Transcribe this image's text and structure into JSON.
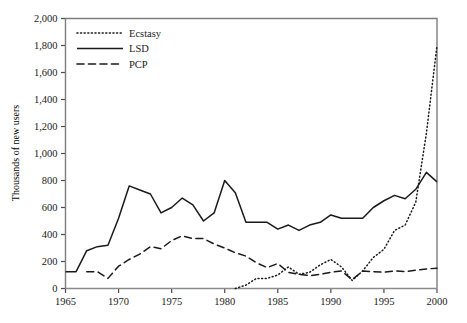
{
  "chart_data": {
    "type": "line",
    "title": "",
    "xlabel": "",
    "ylabel": "Thousands of new users",
    "xlim": [
      1965,
      2000
    ],
    "ylim": [
      0,
      2000
    ],
    "xticks": [
      1965,
      1970,
      1975,
      1980,
      1985,
      1990,
      1995,
      2000
    ],
    "xtick_labels": [
      "1965",
      "1970",
      "1975",
      "1980",
      "1985",
      "1990",
      "1995",
      "2000"
    ],
    "yticks": [
      0,
      200,
      400,
      600,
      800,
      1000,
      1200,
      1400,
      1600,
      1800,
      2000
    ],
    "ytick_labels": [
      "0",
      "200",
      "400",
      "600",
      "800",
      "1,000",
      "1,200",
      "1,400",
      "1,600",
      "1,800",
      "2,000"
    ],
    "grid": false,
    "legend_position": "top-left",
    "x": [
      1965,
      1966,
      1967,
      1968,
      1969,
      1970,
      1971,
      1972,
      1973,
      1974,
      1975,
      1976,
      1977,
      1978,
      1979,
      1980,
      1981,
      1982,
      1983,
      1984,
      1985,
      1986,
      1987,
      1988,
      1989,
      1990,
      1991,
      1992,
      1993,
      1994,
      1995,
      1996,
      1997,
      1998,
      1999,
      2000
    ],
    "series": [
      {
        "name": "Ecstasy",
        "style": "dotted",
        "color": "#1a1a1a",
        "x": [
          1981,
          1982,
          1983,
          1984,
          1985,
          1986,
          1987,
          1988,
          1989,
          1990,
          1991,
          1992,
          1993,
          1994,
          1995,
          1996,
          1997,
          1998,
          1999,
          2000
        ],
        "values": [
          0,
          25,
          75,
          75,
          100,
          160,
          105,
          120,
          175,
          215,
          160,
          60,
          130,
          230,
          290,
          430,
          470,
          640,
          1150,
          1800
        ]
      },
      {
        "name": "LSD",
        "style": "solid",
        "color": "#1a1a1a",
        "x": [
          1965,
          1966,
          1967,
          1968,
          1969,
          1970,
          1971,
          1972,
          1973,
          1974,
          1975,
          1976,
          1977,
          1978,
          1979,
          1980,
          1981,
          1982,
          1983,
          1984,
          1985,
          1986,
          1987,
          1988,
          1989,
          1990,
          1991,
          1992,
          1993,
          1994,
          1995,
          1996,
          1997,
          1998,
          1999,
          2000
        ],
        "values": [
          125,
          125,
          280,
          310,
          320,
          520,
          760,
          730,
          700,
          560,
          600,
          670,
          620,
          500,
          560,
          800,
          710,
          490,
          490,
          490,
          440,
          470,
          430,
          470,
          490,
          545,
          520,
          520,
          520,
          600,
          650,
          690,
          665,
          735,
          860,
          790
        ]
      },
      {
        "name": "PCP",
        "style": "dashed",
        "color": "#1a1a1a",
        "x": [
          1967,
          1968,
          1969,
          1970,
          1971,
          1972,
          1973,
          1974,
          1975,
          1976,
          1977,
          1978,
          1979,
          1980,
          1981,
          1982,
          1983,
          1984,
          1985,
          1986,
          1987,
          1988,
          1989,
          1990,
          1991,
          1992,
          1993,
          1994,
          1995,
          1996,
          1997,
          1998,
          1999,
          2000
        ],
        "values": [
          125,
          125,
          75,
          165,
          215,
          255,
          310,
          295,
          355,
          390,
          370,
          370,
          330,
          300,
          265,
          240,
          190,
          155,
          185,
          120,
          105,
          95,
          105,
          120,
          130,
          65,
          130,
          125,
          120,
          130,
          125,
          135,
          145,
          150
        ]
      }
    ]
  },
  "legend": {
    "items": [
      {
        "label": "Ecstasy",
        "style": "dotted"
      },
      {
        "label": "LSD",
        "style": "solid"
      },
      {
        "label": "PCP",
        "style": "dashed"
      }
    ]
  },
  "axis": {
    "ylabel": "Thousands of new users"
  }
}
